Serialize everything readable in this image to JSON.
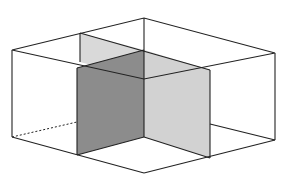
{
  "diagram": {
    "colors": {
      "background": "#ffffff",
      "edge": "#222222",
      "plane_light": "#d4d4d4",
      "plane_mid": "#bdbdbd",
      "plane_dark": "#8a8a8a"
    },
    "labels": []
  }
}
